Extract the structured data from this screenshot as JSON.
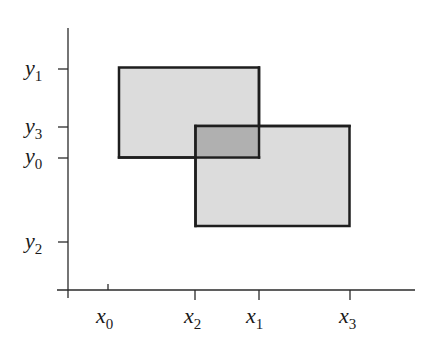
{
  "diagram": {
    "type": "rectangle-intersection",
    "colors": {
      "axis": "#2a2a2a",
      "rect_fill": "#dcdcdc",
      "overlap_fill": "#b0b0b0",
      "rect_stroke": "#1e1e1e"
    },
    "x_ticks": [
      {
        "base": "x",
        "sub": "0",
        "px": 108
      },
      {
        "base": "x",
        "sub": "2",
        "px": 195
      },
      {
        "base": "x",
        "sub": "1",
        "px": 259
      },
      {
        "base": "x",
        "sub": "3",
        "px": 350
      }
    ],
    "y_ticks": [
      {
        "base": "y",
        "sub": "1",
        "px": 69
      },
      {
        "base": "y",
        "sub": "3",
        "px": 127
      },
      {
        "base": "y",
        "sub": "0",
        "px": 158
      },
      {
        "base": "y",
        "sub": "2",
        "px": 242
      }
    ],
    "rectangles": [
      {
        "name": "rect-A",
        "x_from": "x0",
        "x_to": "x1",
        "y_from": "y0",
        "y_to": "y1"
      },
      {
        "name": "rect-B",
        "x_from": "x2",
        "x_to": "x3",
        "y_from": "y2",
        "y_to": "y3"
      }
    ],
    "overlap": {
      "x_from": "x2",
      "x_to": "x1",
      "y_from": "y0",
      "y_to": "y3"
    }
  }
}
